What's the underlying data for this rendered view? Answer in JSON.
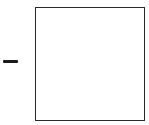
{
  "controls": {
    "minus_icon": "minus-icon"
  },
  "panel": {
    "content": ""
  },
  "colors": {
    "stroke": "#2a2a2a",
    "icon": "#1a1a1a",
    "background": "#ffffff"
  }
}
